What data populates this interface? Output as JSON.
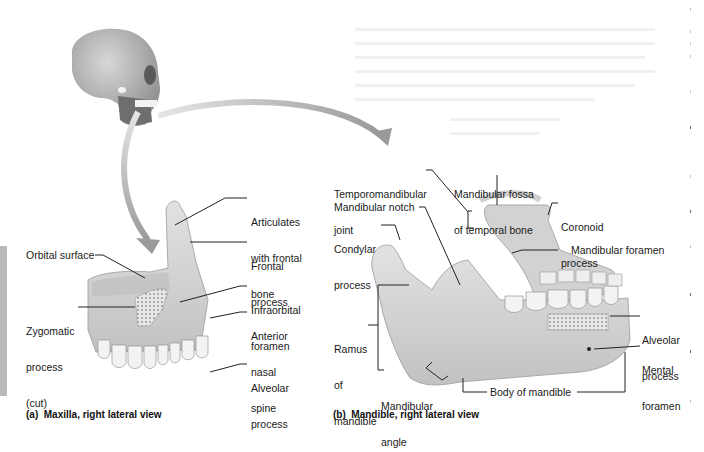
{
  "figure": {
    "panel_a": {
      "caption": "(a)  Maxilla, right lateral view",
      "labels": {
        "articulates": [
          "Articulates",
          "with frontal",
          "bone"
        ],
        "frontal_process": [
          "Frontal",
          "process"
        ],
        "orbital_surface": "Orbital surface",
        "infraorbital_foramen": [
          "Infraorbital",
          "foramen"
        ],
        "zygomatic_process": [
          "Zygomatic",
          "process",
          "(cut)"
        ],
        "anterior_nasal_spine": [
          "Anterior",
          "nasal",
          "spine"
        ],
        "alveolar_process": [
          "Alveolar",
          "process"
        ]
      }
    },
    "panel_b": {
      "caption": "(b)  Mandible, right lateral view",
      "labels": {
        "tmj": [
          "Temporomandibular",
          "joint"
        ],
        "mandibular_fossa": [
          "Mandibular fossa",
          "of temporal bone"
        ],
        "coronoid_process": [
          "Coronoid",
          "process"
        ],
        "mandibular_notch": "Mandibular notch",
        "condylar_process": [
          "Condylar",
          "process"
        ],
        "mandibular_foramen": "Mandibular foramen",
        "ramus": [
          "Ramus",
          "of",
          "mandible"
        ],
        "alveolar_process": [
          "Alveolar",
          "process"
        ],
        "mental_foramen": [
          "Mental",
          "foramen"
        ],
        "mandibular_angle": [
          "Mandibular",
          "angle"
        ],
        "body_of_mandible": "Body of mandible"
      }
    },
    "colors": {
      "bone": "#d9d9d9",
      "bone_shadow": "#a9a9a9",
      "arrow": "#a8a8a8",
      "leader": "#222222",
      "side_bar": "#b9b9b9"
    }
  }
}
